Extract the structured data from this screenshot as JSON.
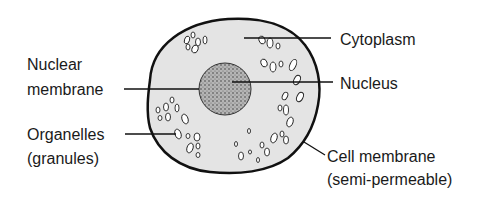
{
  "diagram": {
    "labels": {
      "cytoplasm": "Cytoplasm",
      "nucleus": "Nucleus",
      "nuclear_membrane_line1": "Nuclear",
      "nuclear_membrane_line2": "membrane",
      "organelles_line1": "Organelles",
      "organelles_line2": "(granules)",
      "cell_membrane_line1": "Cell membrane",
      "cell_membrane_line2": "(semi-permeable)"
    },
    "colors": {
      "cytoplasm_fill": "#e6e6e6",
      "nucleus_fill": "#9a9a9a",
      "outline": "#111111"
    }
  }
}
